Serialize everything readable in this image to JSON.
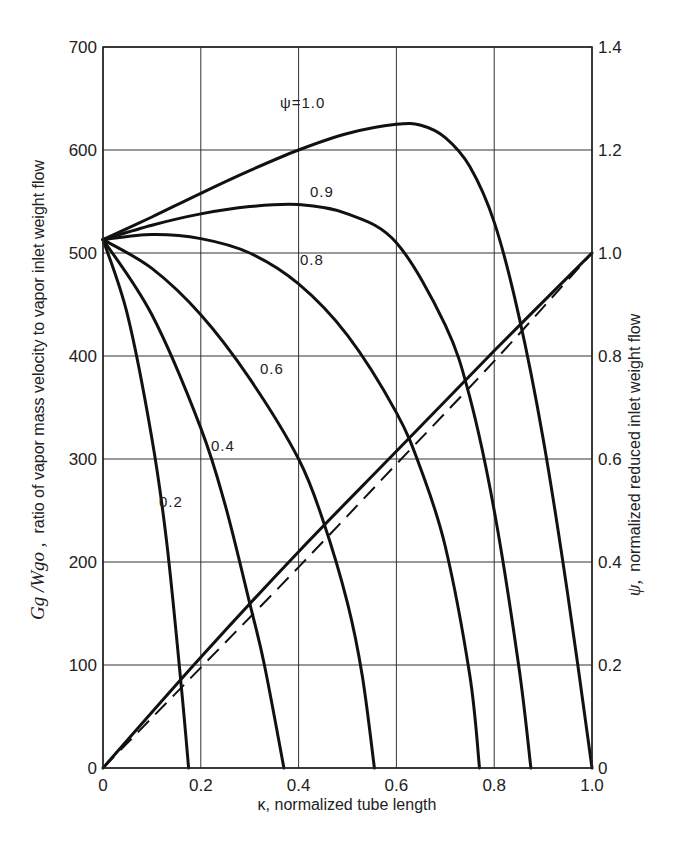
{
  "chart_data": {
    "type": "line",
    "title": "",
    "xlabel": "κ, normalized tube length",
    "ylabel_left": "G_g / W_go , ratio of vapor mass velocity to vapor inlet weight flow",
    "ylabel_left_math": "Gg /Wgo ,",
    "ylabel_left_text": "ratio of vapor mass velocity to vapor inlet weight flow",
    "ylabel_right": "ψ, normalized reduced inlet weight flow",
    "ylabel_right_symbol": "ψ,",
    "ylabel_right_text": "normalized reduced inlet weight flow",
    "xlim": [
      0,
      1.0
    ],
    "ylim_left": [
      0,
      700
    ],
    "ylim_right": [
      0,
      1.4
    ],
    "grid": true,
    "x_ticks": [
      "0",
      "0.2",
      "0.4",
      "0.6",
      "0.8",
      "1.0"
    ],
    "y_left_ticks": [
      "0",
      "100",
      "200",
      "300",
      "400",
      "500",
      "600",
      "700"
    ],
    "y_right_ticks": [
      "0",
      "0.2",
      "0.4",
      "0.6",
      "0.8",
      "1.0",
      "1.2",
      "1.4"
    ],
    "series": [
      {
        "name": "ψ=1.0",
        "label": "ψ=1.0",
        "axis": "left",
        "x": [
          0,
          0.1,
          0.2,
          0.3,
          0.4,
          0.5,
          0.6,
          0.65,
          0.7,
          0.75,
          0.8,
          0.85,
          0.9,
          0.95,
          1.0
        ],
        "y": [
          513,
          535,
          558,
          580,
          600,
          616,
          625,
          624,
          612,
          584,
          530,
          440,
          320,
          170,
          0
        ]
      },
      {
        "name": "ψ=0.9",
        "label": "0.9",
        "axis": "left",
        "x": [
          0,
          0.1,
          0.2,
          0.3,
          0.4,
          0.5,
          0.6,
          0.7,
          0.75,
          0.8,
          0.85,
          0.875
        ],
        "y": [
          513,
          527,
          538,
          545,
          547,
          538,
          510,
          430,
          360,
          250,
          100,
          0
        ]
      },
      {
        "name": "ψ=0.8",
        "label": "0.8",
        "axis": "left",
        "x": [
          0,
          0.1,
          0.2,
          0.3,
          0.4,
          0.5,
          0.6,
          0.65,
          0.7,
          0.75,
          0.77
        ],
        "y": [
          513,
          518,
          514,
          500,
          470,
          420,
          345,
          290,
          215,
          90,
          0
        ]
      },
      {
        "name": "ψ=0.6",
        "label": "0.6",
        "axis": "left",
        "x": [
          0,
          0.1,
          0.2,
          0.3,
          0.4,
          0.45,
          0.5,
          0.53,
          0.555
        ],
        "y": [
          513,
          485,
          440,
          378,
          300,
          240,
          160,
          90,
          0
        ]
      },
      {
        "name": "ψ=0.4",
        "label": "0.4",
        "axis": "left",
        "x": [
          0,
          0.1,
          0.2,
          0.25,
          0.3,
          0.33,
          0.37
        ],
        "y": [
          513,
          440,
          330,
          255,
          160,
          100,
          0
        ]
      },
      {
        "name": "ψ=0.2",
        "label": "0.2",
        "axis": "left",
        "x": [
          0,
          0.05,
          0.1,
          0.13,
          0.16,
          0.175
        ],
        "y": [
          513,
          440,
          320,
          220,
          80,
          0
        ]
      },
      {
        "name": "ψ vs κ (solid)",
        "label": "",
        "axis": "right",
        "style": "solid",
        "x": [
          0,
          0.2,
          0.4,
          0.6,
          0.8,
          1.0
        ],
        "y": [
          0,
          0.215,
          0.42,
          0.615,
          0.81,
          1.0
        ]
      },
      {
        "name": "ψ vs κ (dashed)",
        "label": "",
        "axis": "right",
        "style": "dashed",
        "x": [
          0,
          0.2,
          0.4,
          0.6,
          0.8,
          1.0
        ],
        "y": [
          0,
          0.195,
          0.39,
          0.59,
          0.79,
          1.0
        ]
      }
    ]
  }
}
